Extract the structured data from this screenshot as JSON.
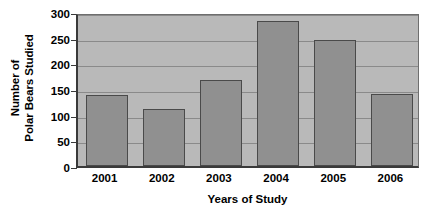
{
  "chart_data": {
    "type": "bar",
    "title": "",
    "subtitle": "",
    "xlabel": "Years of Study",
    "ylabel": "Number of Polar Bears Studied",
    "ylabel_line1": "Number of",
    "ylabel_line2": "Polar Bears Studied",
    "categories": [
      "2001",
      "2002",
      "2003",
      "2004",
      "2005",
      "2006"
    ],
    "values": [
      138,
      112,
      168,
      283,
      245,
      140
    ],
    "series": [
      {
        "name": "Polar Bears Studied",
        "values": [
          138,
          112,
          168,
          283,
          245,
          140
        ]
      }
    ],
    "ylim": [
      0,
      300
    ],
    "yticks": [
      0,
      50,
      100,
      150,
      200,
      250,
      300
    ],
    "ytick_labels": [
      "0",
      "50",
      "100",
      "150",
      "200",
      "250",
      "300"
    ],
    "grid": true,
    "grid_axis": "y",
    "legend": false,
    "legend_position": "none",
    "colors": {
      "bar_fill": "#909090",
      "bar_border": "#4a4a4a",
      "plot_background": "#b9b9b9",
      "gridline": "#8a8a8a",
      "axis": "#3a3a3a",
      "text": "#000000",
      "figure_background": "#ffffff"
    }
  }
}
